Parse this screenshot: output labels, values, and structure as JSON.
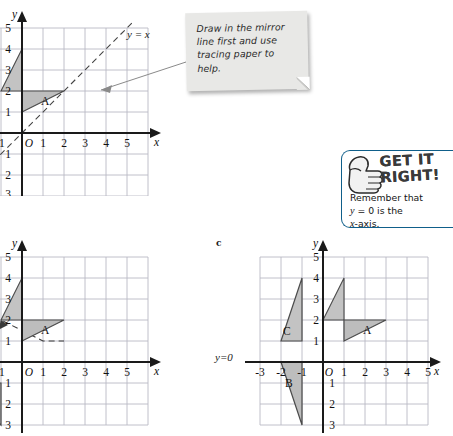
{
  "note": {
    "icon": "sticky-note",
    "text": "Draw in the mirror line first and use tracing paper to help."
  },
  "get_it_right": {
    "icon": "thumbs-up-icon",
    "title": "GET IT\nRIGHT!",
    "line1": "Remember that",
    "line2_math_y": "y",
    "line2_rest": " = 0 is the",
    "line3_math_x": "x",
    "line3_rest": "-axis.",
    "border_color": "#0f5f8a"
  },
  "graphs": [
    {
      "id": "a",
      "label": "",
      "axis_x_name": "x",
      "axis_y_name": "y",
      "x_ticks": [
        "-1",
        "1",
        "2",
        "3",
        "4",
        "5"
      ],
      "y_ticks": [
        "5",
        "4",
        "3",
        "2",
        "1",
        "1",
        "2",
        "3"
      ],
      "origin_label": "O",
      "mirror_line_label": "y = x",
      "shapes": [
        {
          "name": "A",
          "label": "A",
          "points": [
            [
              2,
              1
            ],
            [
              4,
              2
            ],
            [
              2,
              2
            ]
          ],
          "fill": "#b9b9b9"
        },
        {
          "name": "image-of-A",
          "label": "",
          "points": [
            [
              1,
              2
            ],
            [
              2,
              4
            ],
            [
              2,
              2
            ]
          ],
          "fill": "#c3c3c3"
        }
      ]
    },
    {
      "id": "b",
      "label": "",
      "axis_x_name": "x",
      "axis_y_name": "y",
      "x_ticks": [
        "-1",
        "1",
        "2",
        "3",
        "4",
        "5"
      ],
      "y_ticks": [
        "5",
        "4",
        "3",
        "2",
        "1",
        "1",
        "2",
        "3"
      ],
      "origin_label": "O",
      "mirror_line_label": "",
      "shapes": [
        {
          "name": "A",
          "label": "A",
          "points": [
            [
              2,
              1
            ],
            [
              4,
              2
            ],
            [
              2,
              2
            ]
          ],
          "fill": "#b9b9b9"
        },
        {
          "name": "image-of-A",
          "label": "",
          "points": [
            [
              1,
              2
            ],
            [
              2,
              4
            ],
            [
              2,
              2
            ]
          ],
          "fill": "#c3c3c3"
        },
        {
          "name": "B",
          "label": "B",
          "points": [
            [
              -3,
              -1
            ],
            [
              -1,
              -1
            ],
            [
              -1,
              -3
            ]
          ],
          "fill": "#b9b9b9"
        }
      ]
    },
    {
      "id": "c",
      "label": "c",
      "axis_x_name": "x",
      "axis_y_name": "y",
      "x_ticks": [
        "-3",
        "-2",
        "-1",
        "1",
        "2",
        "3",
        "4",
        "5"
      ],
      "y_ticks": [
        "5",
        "4",
        "3",
        "2",
        "1",
        "1",
        "2",
        "3"
      ],
      "origin_label": "O",
      "mirror_line_label": "y=0",
      "shapes": [
        {
          "name": "A",
          "label": "A",
          "points": [
            [
              2,
              1
            ],
            [
              4,
              2
            ],
            [
              2,
              2
            ]
          ],
          "fill": "#b9b9b9"
        },
        {
          "name": "image-of-A",
          "label": "",
          "points": [
            [
              1,
              2
            ],
            [
              2,
              4
            ],
            [
              2,
              2
            ]
          ],
          "fill": "#c3c3c3"
        },
        {
          "name": "B",
          "label": "B",
          "points": [
            [
              -2,
              0
            ],
            [
              -1,
              0
            ],
            [
              -1,
              -3
            ]
          ],
          "fill": "#b9b9b9"
        },
        {
          "name": "C",
          "label": "C",
          "points": [
            [
              -1,
              3
            ],
            [
              -1,
              1
            ],
            [
              -2,
              1
            ]
          ],
          "fill": "#c3c3c3"
        }
      ]
    }
  ],
  "colors": {
    "grid": "#b9b9c4",
    "axis": "#1a1a1a",
    "shape_fill": "#bdbdbd",
    "shape_stroke": "#3a3a3a",
    "dashed": "#3a3a3a"
  }
}
